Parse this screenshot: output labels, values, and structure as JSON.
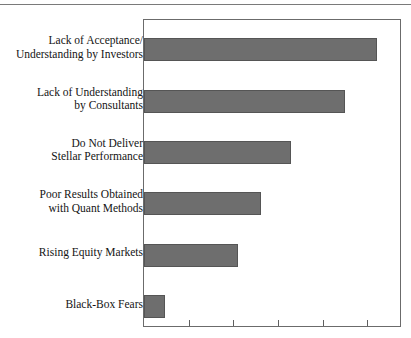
{
  "chart_data": {
    "type": "bar",
    "orientation": "horizontal",
    "title": "",
    "xlabel": "",
    "ylabel": "",
    "categories": [
      "Lack of Acceptance / Understanding by Investors",
      "Lack of Understanding by Consultants",
      "Do Not Deliver Stellar Performance",
      "Poor Results Obtained with Quant Methods",
      "Rising Equity Markets",
      "Black-Box Fears"
    ],
    "category_lines": [
      [
        "Lack of Acceptance/",
        "Understanding by Investors"
      ],
      [
        "Lack of Understanding",
        "by Consultants"
      ],
      [
        "Do Not Deliver",
        "Stellar Performance"
      ],
      [
        "Poor Results Obtained",
        "with Quant Methods"
      ],
      [
        "Rising Equity Markets"
      ],
      [
        "Black-Box Fears"
      ]
    ],
    "values": [
      5.22,
      4.49,
      3.29,
      2.62,
      2.11,
      0.47
    ],
    "xlim": [
      0,
      5.73
    ],
    "xticks": [
      0,
      1,
      2,
      3,
      4,
      5
    ],
    "xtick_labels": [
      "",
      "",
      "",
      "",
      "",
      ""
    ],
    "grid": false,
    "legend": false,
    "bar_color": "#6e6e6e",
    "frame_color": "#6b6b6b"
  },
  "figure": {
    "title_cropped": true
  }
}
